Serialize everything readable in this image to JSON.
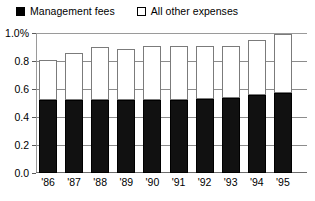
{
  "legend": {
    "entries": [
      {
        "label": "Management fees",
        "swatch": "filled-black-square",
        "color": "#000000"
      },
      {
        "label": "All other expenses",
        "swatch": "hollow-white-square",
        "color": "#ffffff"
      }
    ]
  },
  "axes": {
    "y_tick_labels": [
      "1.0%",
      "0.8",
      "0.6",
      "0.4",
      "0.2",
      "0.0"
    ],
    "y_tick_values": [
      1.0,
      0.8,
      0.6,
      0.4,
      0.2,
      0.0
    ],
    "x_tick_labels": [
      "'86",
      "'87",
      "'88",
      "'89",
      "'90",
      "'91",
      "'92",
      "'93",
      "'94",
      "'95"
    ]
  },
  "chart_data": {
    "type": "bar",
    "stacked": true,
    "title": "",
    "subtitle": "",
    "xlabel": "",
    "ylabel": "",
    "ylim": [
      0.0,
      1.0
    ],
    "yunit": "%",
    "grid": true,
    "legend_position": "top-left",
    "categories": [
      "'86",
      "'87",
      "'88",
      "'89",
      "'90",
      "'91",
      "'92",
      "'93",
      "'94",
      "'95"
    ],
    "series": [
      {
        "name": "Management fees",
        "color": "#000000",
        "values": [
          0.52,
          0.52,
          0.52,
          0.52,
          0.52,
          0.52,
          0.53,
          0.535,
          0.555,
          0.57
        ]
      },
      {
        "name": "All other expenses",
        "color": "#ffffff",
        "values": [
          0.29,
          0.34,
          0.38,
          0.365,
          0.385,
          0.39,
          0.375,
          0.37,
          0.395,
          0.42
        ]
      }
    ],
    "totals": [
      0.81,
      0.86,
      0.9,
      0.885,
      0.905,
      0.91,
      0.905,
      0.905,
      0.95,
      0.99
    ]
  }
}
